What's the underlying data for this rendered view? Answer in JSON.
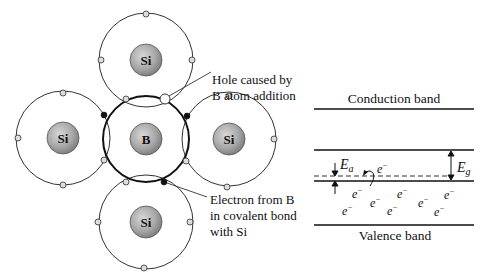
{
  "figure": {
    "lattice": {
      "atoms": [
        {
          "id": "si-top",
          "symbol": "Si",
          "cx": 146,
          "cy": 60
        },
        {
          "id": "si-left",
          "symbol": "Si",
          "cx": 63,
          "cy": 138
        },
        {
          "id": "b-center",
          "symbol": "B",
          "cx": 146,
          "cy": 139
        },
        {
          "id": "si-right",
          "symbol": "Si",
          "cx": 229,
          "cy": 139
        },
        {
          "id": "si-bottom",
          "symbol": "Si",
          "cx": 146,
          "cy": 222
        }
      ],
      "annotations": {
        "hole_line1": "Hole caused by",
        "hole_line2": "B atom addition",
        "electron_line1": "Electron from B",
        "electron_line2": "in covalent bond",
        "electron_line3": "with Si"
      }
    },
    "band_diagram": {
      "conduction_label": "Conduction band",
      "valence_label": "Valence band",
      "acceptor_energy_label": "E",
      "acceptor_energy_sub": "a",
      "gap_energy_label": "E",
      "gap_energy_sub": "g",
      "electron_symbol": "e",
      "electron_sup": "−"
    }
  }
}
